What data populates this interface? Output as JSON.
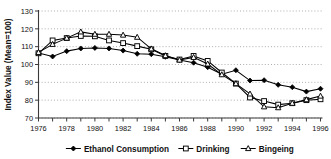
{
  "chart_data": {
    "type": "line",
    "title": "",
    "xlabel": "",
    "ylabel": "Index Value (Mean=100)",
    "xlim": [
      1976,
      1996
    ],
    "ylim": [
      70,
      130
    ],
    "yticks": [
      70,
      80,
      90,
      100,
      110,
      120,
      130
    ],
    "xticks": [
      1976,
      1977,
      1978,
      1979,
      1980,
      1981,
      1982,
      1983,
      1984,
      1985,
      1986,
      1987,
      1988,
      1989,
      1990,
      1991,
      1992,
      1993,
      1994,
      1995,
      1996
    ],
    "xtick_labels": [
      "1976",
      "",
      "1978",
      "",
      "1980",
      "",
      "1982",
      "",
      "1984",
      "",
      "1986",
      "",
      "1988",
      "",
      "1990",
      "",
      "1992",
      "",
      "1994",
      "",
      "1996"
    ],
    "grid": "horizontal-dotted",
    "legend_position": "bottom",
    "x": [
      1976,
      1977,
      1978,
      1979,
      1980,
      1981,
      1982,
      1983,
      1984,
      1985,
      1986,
      1987,
      1988,
      1989,
      1990,
      1991,
      1992,
      1993,
      1994,
      1995,
      1996
    ],
    "series": [
      {
        "name": "Ethanol Consumption",
        "marker": "filled-diamond",
        "values": [
          106.5,
          104.5,
          107.5,
          109.0,
          109.3,
          109.0,
          107.8,
          106.0,
          105.8,
          104.3,
          102.5,
          101.0,
          98.5,
          94.5,
          96.8,
          91.0,
          91.2,
          88.6,
          87.3,
          84.8,
          86.4
        ]
      },
      {
        "name": "Drinking",
        "marker": "open-square",
        "values": [
          106.3,
          113.5,
          114.8,
          116.0,
          115.8,
          113.5,
          112.0,
          110.3,
          108.5,
          104.8,
          102.8,
          104.8,
          102.0,
          95.5,
          89.3,
          81.5,
          79.5,
          77.5,
          78.3,
          80.0,
          80.5
        ]
      },
      {
        "name": "Bingeing",
        "marker": "open-triangle",
        "values": [
          106.8,
          111.3,
          114.8,
          118.3,
          117.0,
          117.0,
          116.5,
          115.3,
          108.8,
          105.0,
          102.5,
          104.0,
          100.3,
          94.3,
          89.3,
          83.5,
          76.3,
          75.8,
          78.3,
          80.3,
          82.3
        ]
      }
    ]
  },
  "legend": {
    "items": [
      {
        "label": "Ethanol Consumption",
        "marker": "filled-diamond"
      },
      {
        "label": "Drinking",
        "marker": "open-square"
      },
      {
        "label": "Bingeing",
        "marker": "open-triangle"
      }
    ]
  },
  "colors": {
    "axis": "#3a3a3a",
    "grid": "#9a9a9a",
    "series": "#000000",
    "background": "#ffffff",
    "text": "#111111"
  }
}
